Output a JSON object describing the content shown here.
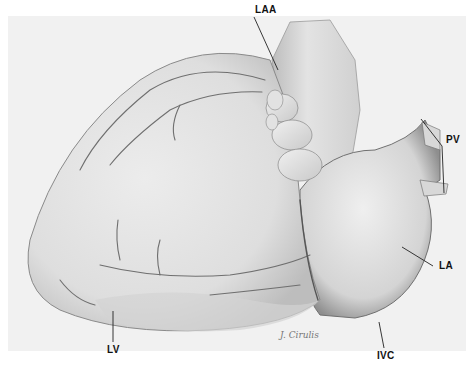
{
  "figure": {
    "background_color": "#ffffff",
    "paper_color": "#f1f1f1",
    "labels": [
      {
        "id": "laa",
        "text": "LAA",
        "x": 254,
        "y": 4
      },
      {
        "id": "pv",
        "text": "PV",
        "x": 448,
        "y": 137
      },
      {
        "id": "la",
        "text": "LA",
        "x": 440,
        "y": 262
      },
      {
        "id": "lv",
        "text": "LV",
        "x": 109,
        "y": 346
      },
      {
        "id": "ivc",
        "text": "IVC",
        "x": 380,
        "y": 352
      }
    ],
    "signature": "J. Cirulis"
  }
}
